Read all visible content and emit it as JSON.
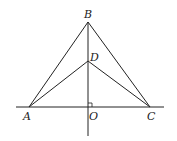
{
  "diagram": {
    "type": "geometry",
    "points": {
      "A": {
        "label": "A",
        "x": 29,
        "y": 107
      },
      "B": {
        "label": "B",
        "x": 88,
        "y": 22
      },
      "C": {
        "label": "C",
        "x": 150,
        "y": 107
      },
      "D": {
        "label": "D",
        "x": 88,
        "y": 61
      },
      "O": {
        "label": "O",
        "x": 88,
        "y": 107
      }
    },
    "segments": [
      "AB",
      "BC",
      "AD",
      "DC",
      "BO"
    ],
    "lines": [
      "horizontal line through A, O, C",
      "vertical line through B, D, O"
    ],
    "right_angle_at": "O",
    "stroke_color": "#222222"
  }
}
